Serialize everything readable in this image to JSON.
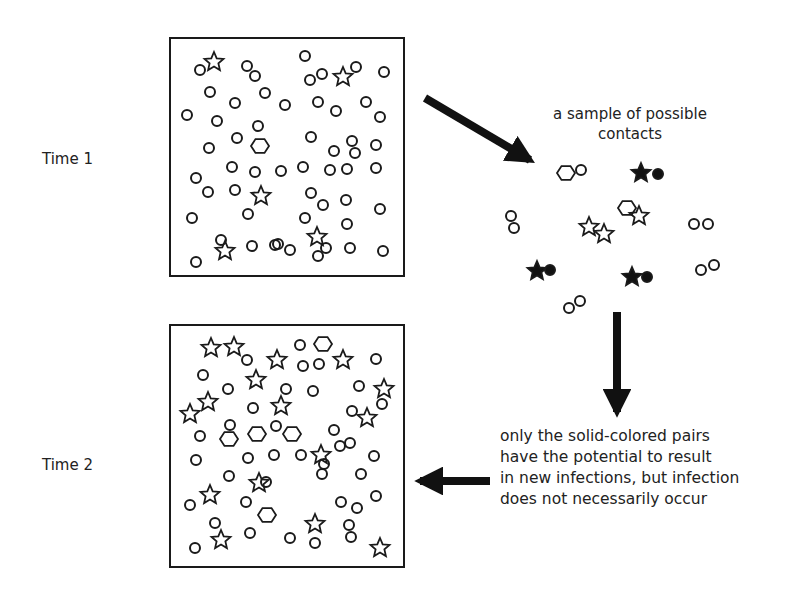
{
  "labels": {
    "time1": "Time 1",
    "time2": "Time 2"
  },
  "captions": {
    "sample_line1": "a sample of possible",
    "sample_line2": "contacts",
    "result_lines": [
      "only the solid-colored pairs",
      "have the potential to result",
      "in new infections, but infection",
      "does not necessarily occur"
    ]
  },
  "colors": {
    "stroke": "#1a1a1a",
    "fill_solid": "#111111",
    "background": "#ffffff"
  },
  "legend_semantics": {
    "circle": "susceptible individual",
    "star": "infected individual",
    "hexagon": "recovered / immune individual"
  },
  "time1_box": {
    "x": 170,
    "y": 38,
    "w": 234,
    "h": 238,
    "circles": [
      [
        200,
        70
      ],
      [
        247,
        66
      ],
      [
        255,
        76
      ],
      [
        305,
        56
      ],
      [
        310,
        80
      ],
      [
        322,
        74
      ],
      [
        356,
        67
      ],
      [
        384,
        72
      ],
      [
        210,
        92
      ],
      [
        265,
        93
      ],
      [
        235,
        103
      ],
      [
        285,
        105
      ],
      [
        318,
        102
      ],
      [
        336,
        111
      ],
      [
        366,
        102
      ],
      [
        187,
        115
      ],
      [
        217,
        121
      ],
      [
        258,
        126
      ],
      [
        380,
        117
      ],
      [
        237,
        138
      ],
      [
        311,
        137
      ],
      [
        334,
        151
      ],
      [
        352,
        141
      ],
      [
        355,
        153
      ],
      [
        376,
        145
      ],
      [
        209,
        148
      ],
      [
        196,
        178
      ],
      [
        232,
        167
      ],
      [
        255,
        172
      ],
      [
        281,
        171
      ],
      [
        303,
        167
      ],
      [
        330,
        170
      ],
      [
        347,
        169
      ],
      [
        376,
        168
      ],
      [
        208,
        192
      ],
      [
        235,
        190
      ],
      [
        311,
        193
      ],
      [
        323,
        205
      ],
      [
        346,
        200
      ],
      [
        380,
        209
      ],
      [
        192,
        218
      ],
      [
        248,
        214
      ],
      [
        305,
        218
      ],
      [
        347,
        224
      ],
      [
        221,
        240
      ],
      [
        275,
        245
      ],
      [
        278,
        244
      ],
      [
        326,
        248
      ],
      [
        290,
        250
      ],
      [
        350,
        248
      ],
      [
        383,
        251
      ],
      [
        196,
        262
      ],
      [
        252,
        246
      ],
      [
        318,
        256
      ]
    ],
    "stars": [
      [
        214,
        62
      ],
      [
        343,
        77
      ],
      [
        261,
        196
      ],
      [
        225,
        251
      ],
      [
        317,
        237
      ]
    ],
    "hexagons": [
      [
        260,
        146
      ]
    ]
  },
  "time2_box": {
    "x": 170,
    "y": 325,
    "w": 234,
    "h": 242,
    "circles": [
      [
        247,
        360
      ],
      [
        300,
        345
      ],
      [
        319,
        364
      ],
      [
        303,
        366
      ],
      [
        376,
        359
      ],
      [
        203,
        375
      ],
      [
        228,
        389
      ],
      [
        253,
        408
      ],
      [
        286,
        389
      ],
      [
        313,
        391
      ],
      [
        359,
        386
      ],
      [
        200,
        436
      ],
      [
        230,
        425
      ],
      [
        276,
        426
      ],
      [
        334,
        430
      ],
      [
        340,
        446
      ],
      [
        352,
        411
      ],
      [
        382,
        404
      ],
      [
        196,
        460
      ],
      [
        248,
        458
      ],
      [
        274,
        455
      ],
      [
        301,
        455
      ],
      [
        324,
        464
      ],
      [
        350,
        443
      ],
      [
        374,
        456
      ],
      [
        229,
        476
      ],
      [
        266,
        482
      ],
      [
        322,
        474
      ],
      [
        361,
        474
      ],
      [
        376,
        496
      ],
      [
        190,
        505
      ],
      [
        246,
        502
      ],
      [
        341,
        502
      ],
      [
        357,
        508
      ],
      [
        349,
        525
      ],
      [
        215,
        523
      ],
      [
        250,
        533
      ],
      [
        290,
        538
      ],
      [
        315,
        543
      ],
      [
        351,
        537
      ],
      [
        195,
        548
      ]
    ],
    "stars": [
      [
        211,
        348
      ],
      [
        234,
        347
      ],
      [
        277,
        360
      ],
      [
        343,
        360
      ],
      [
        256,
        380
      ],
      [
        208,
        402
      ],
      [
        190,
        414
      ],
      [
        281,
        406
      ],
      [
        384,
        389
      ],
      [
        367,
        418
      ],
      [
        321,
        455
      ],
      [
        210,
        495
      ],
      [
        259,
        483
      ],
      [
        315,
        524
      ],
      [
        221,
        540
      ],
      [
        380,
        548
      ]
    ],
    "hexagons": [
      [
        323,
        344
      ],
      [
        229,
        439
      ],
      [
        257,
        434
      ],
      [
        292,
        434
      ],
      [
        267,
        515
      ]
    ]
  },
  "sample_contacts": {
    "hex_circle": [
      [
        566,
        173,
        581,
        170
      ],
      [
        628,
        208,
        0,
        0
      ]
    ],
    "open_pairs_circles": [
      [
        511,
        216
      ],
      [
        514,
        228
      ],
      [
        694,
        224
      ],
      [
        708,
        224
      ],
      [
        701,
        270
      ],
      [
        714,
        265
      ],
      [
        569,
        308
      ],
      [
        580,
        301
      ]
    ],
    "open_stars": [
      [
        589,
        227
      ],
      [
        604,
        234
      ],
      [
        639,
        216
      ]
    ],
    "open_hexagons": [
      [
        566,
        173
      ],
      [
        627,
        208
      ]
    ],
    "open_circles_single": [
      [
        581,
        170
      ]
    ],
    "solid_stars": [
      [
        641,
        173
      ],
      [
        537,
        271
      ],
      [
        632,
        277
      ]
    ],
    "solid_circles": [
      [
        658,
        174
      ],
      [
        550,
        270
      ],
      [
        647,
        277
      ]
    ]
  },
  "arrows": [
    {
      "name": "arrow-to-sample",
      "from": [
        425,
        98
      ],
      "to": [
        530,
        160
      ]
    },
    {
      "name": "arrow-down",
      "from": [
        617,
        312
      ],
      "to": [
        617,
        412
      ]
    },
    {
      "name": "arrow-to-time2",
      "from": [
        490,
        481
      ],
      "to": [
        420,
        481
      ]
    }
  ]
}
